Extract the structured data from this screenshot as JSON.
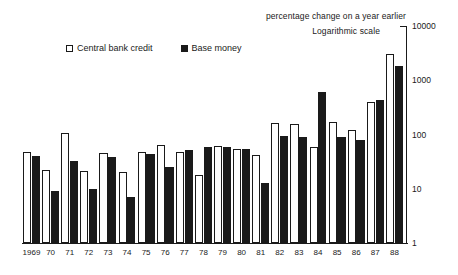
{
  "annotations": {
    "percentage_note": "percentage change on a year earlier",
    "scale_note": "Logarithmic scale"
  },
  "legend": {
    "items": [
      {
        "label": "Central bank credit",
        "style": "open",
        "color": "#ffffff",
        "icon": "open-square-icon"
      },
      {
        "label": "Base money",
        "style": "solid",
        "color": "#1a1a1a",
        "icon": "filled-square-icon"
      }
    ]
  },
  "chart_data": {
    "type": "bar",
    "title": "",
    "subtitle": "percentage change on a year earlier",
    "xlabel": "",
    "ylabel": "",
    "scale": "log",
    "grid": false,
    "legend_position": "top-left",
    "ylim": [
      1,
      10000
    ],
    "yticks": [
      1,
      10,
      100,
      1000,
      10000
    ],
    "ytick_labels": [
      "1",
      "10",
      "100",
      "1000",
      "10000"
    ],
    "categories": [
      "1969",
      "70",
      "71",
      "72",
      "73",
      "74",
      "75",
      "76",
      "77",
      "78",
      "79",
      "80",
      "81",
      "82",
      "83",
      "84",
      "85",
      "86",
      "87",
      "88"
    ],
    "series": [
      {
        "name": "Central bank credit",
        "color": "#ffffff",
        "values": [
          48,
          22,
          105,
          21,
          46,
          20,
          48,
          63,
          47,
          18,
          62,
          55,
          42,
          160,
          155,
          58,
          170,
          120,
          400,
          3100
        ]
      },
      {
        "name": "Base money",
        "color": "#1a1a1a",
        "values": [
          40,
          9,
          32,
          10,
          38,
          7,
          44,
          25,
          52,
          60,
          58,
          55,
          13,
          92,
          90,
          600,
          90,
          80,
          440,
          1800
        ]
      }
    ]
  }
}
